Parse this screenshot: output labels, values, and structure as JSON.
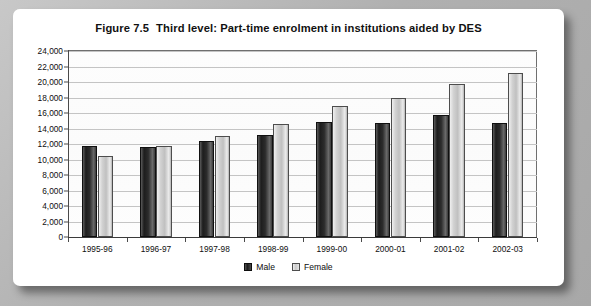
{
  "figure": {
    "number": "Figure 7.5",
    "title": "Third level: Part-time enrolment in institutions aided by DES"
  },
  "legend": {
    "male_label": "Male",
    "female_label": "Female",
    "male_color": "#1d1d1d",
    "female_color": "#c9c9c9",
    "position": "bottom-center"
  },
  "chart_data": {
    "type": "bar",
    "xlabel": "",
    "ylabel": "",
    "ylim": [
      0,
      24000
    ],
    "ytick_step": 2000,
    "grid": true,
    "categories": [
      "1995-96",
      "1996-97",
      "1997-98",
      "1998-99",
      "1999-00",
      "2000-01",
      "2001-02",
      "2002-03"
    ],
    "ytick_labels": [
      "0",
      "2,000",
      "4,000",
      "6,000",
      "8,000",
      "10,000",
      "12,000",
      "14,000",
      "16,000",
      "18,000",
      "20,000",
      "22,000",
      "24,000"
    ],
    "series": [
      {
        "name": "Male",
        "color": "#1d1d1d",
        "values": [
          11800,
          11600,
          12400,
          13200,
          14800,
          14700,
          15700,
          14700
        ]
      },
      {
        "name": "Female",
        "color": "#c9c9c9",
        "values": [
          10500,
          11800,
          13000,
          14600,
          16900,
          17900,
          19700,
          21100
        ]
      }
    ]
  }
}
